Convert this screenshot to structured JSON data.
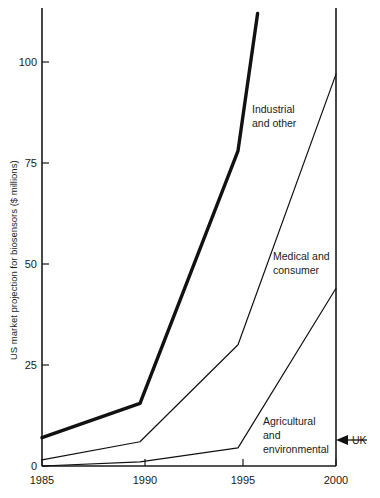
{
  "chart_data": {
    "type": "line",
    "title": "",
    "xlabel": "",
    "ylabel": "US market projection for biosensors ($ millions)",
    "x": [
      1985,
      1990,
      1995,
      1996,
      2000
    ],
    "xlim": [
      1985,
      2000
    ],
    "ylim": [
      0,
      115
    ],
    "xticks": [
      "1985",
      "1990",
      "1995",
      "2000"
    ],
    "xtick_values": [
      1985,
      1990,
      1995,
      2000
    ],
    "yticks": [
      "0",
      "25",
      "50",
      "75",
      "100"
    ],
    "ytick_values": [
      0,
      25,
      50,
      75,
      100
    ],
    "grid": false,
    "legend_position": "inline-labels",
    "series": [
      {
        "name": "Industrial and other",
        "label_line1": "Industrial",
        "label_line2": "and other",
        "x": [
          1985,
          1990,
          1995,
          1996
        ],
        "values": [
          7,
          15.5,
          78,
          112
        ],
        "style": "thick",
        "stroke_width": 3.4,
        "color": "#111111",
        "clipped_at_top": true
      },
      {
        "name": "Medical and consumer",
        "label_line1": "Medical and",
        "label_line2": "consumer",
        "x": [
          1985,
          1990,
          1995,
          2000
        ],
        "values": [
          1.5,
          6,
          30,
          97
        ],
        "style": "thin",
        "stroke_width": 1.2,
        "color": "#111111",
        "clipped_at_top": false
      },
      {
        "name": "Agricultural and environmental",
        "label_line1": "Agricultural",
        "label_line2": "and",
        "label_line3": "environmental",
        "x": [
          1985,
          1990,
          1995,
          2000
        ],
        "values": [
          0,
          1,
          4.5,
          44
        ],
        "style": "thin",
        "stroke_width": 1.2,
        "color": "#111111",
        "clipped_at_top": false
      }
    ],
    "annotations": [
      {
        "name": "uk-marker",
        "text": "UK",
        "arrow": "left",
        "at_x": 2000,
        "at_y": 5
      }
    ]
  }
}
